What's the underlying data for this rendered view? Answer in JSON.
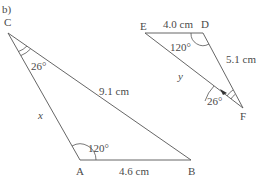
{
  "part_label": "b)",
  "triangle_abc": {
    "vertices": {
      "A": "A",
      "B": "B",
      "C": "C"
    },
    "sides": {
      "CB": "9.1 cm",
      "AB": "4.6 cm",
      "CA": "x"
    },
    "angles": {
      "C": "26°",
      "A": "120°"
    }
  },
  "triangle_def": {
    "vertices": {
      "D": "D",
      "E": "E",
      "F": "F"
    },
    "sides": {
      "ED": "4.0 cm",
      "DF": "5.1 cm",
      "EF": "y"
    },
    "angles": {
      "D": "120°",
      "F": "26°"
    }
  },
  "colors": {
    "line": "#555555",
    "text": "#4a4a4a",
    "background": "#ffffff"
  }
}
